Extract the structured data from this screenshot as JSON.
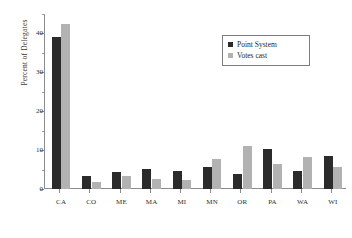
{
  "chart_data": {
    "type": "bar",
    "title": "",
    "xlabel": "",
    "ylabel": "Percent of Delegates",
    "ylim": [
      0,
      45
    ],
    "yticks": [
      0,
      10,
      20,
      30,
      40
    ],
    "ytick_labels": [
      "0",
      "10",
      "20",
      "30",
      "40"
    ],
    "grid": false,
    "legend_position": "top-right",
    "categories": [
      "CA",
      "CO",
      "ME",
      "MA",
      "MI",
      "MN",
      "OR",
      "PA",
      "WA",
      "WI"
    ],
    "series": [
      {
        "name": "Point System",
        "color": "#2b2b2b",
        "values": [
          39.0,
          3.4,
          4.4,
          5.2,
          4.7,
          5.6,
          3.9,
          10.4,
          4.6,
          8.4
        ]
      },
      {
        "name": "Votes cast",
        "color": "#b2b2b2",
        "values": [
          42.5,
          1.8,
          3.4,
          2.6,
          2.2,
          7.8,
          11.0,
          6.4,
          8.3,
          5.6
        ]
      }
    ]
  },
  "legend": {
    "items": [
      {
        "label": "Point System",
        "swatch": "dark-square-swatch"
      },
      {
        "label": "Votes cast",
        "swatch": "light-square-swatch"
      }
    ]
  }
}
